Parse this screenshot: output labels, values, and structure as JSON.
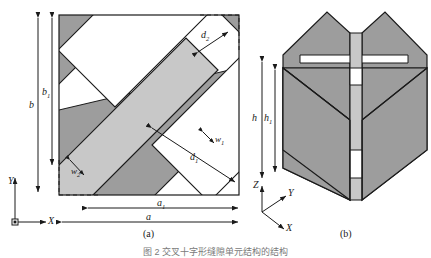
{
  "figure": {
    "panels": [
      {
        "id": "a",
        "label": "(a)"
      },
      {
        "id": "b",
        "label": "(b)"
      }
    ],
    "caption": "图 2    交叉十字形缝隙单元结构的结构"
  },
  "panel_a": {
    "name": "top-view",
    "dimensions": {
      "b": "b",
      "b1": "b",
      "b1_sub": "1",
      "a": "a",
      "a1": "a",
      "a1_sub": "1",
      "d1": "d",
      "d1_sub": "1",
      "d2": "d",
      "d2_sub": "2",
      "w1": "w",
      "w1_sub": "1",
      "w2": "w",
      "w2_sub": "2"
    },
    "axes": {
      "x": "X",
      "y": "Y"
    }
  },
  "panel_b": {
    "name": "perspective-view",
    "dimensions": {
      "h": "h",
      "h1": "h",
      "h1_sub": "1"
    },
    "axes": {
      "x": "X",
      "y": "Y",
      "z": "Z"
    }
  },
  "colors": {
    "substrate_fill": "#9d9d9d",
    "strip_fill": "#c8c8c8",
    "slot_fill": "#ffffff",
    "outline": "#1a1a1a",
    "caption_text": "#7a7a7a"
  }
}
